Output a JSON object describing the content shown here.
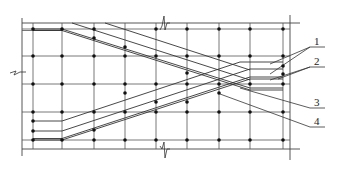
{
  "diagram": {
    "type": "structural-rebar-plan",
    "colors": {
      "line": "#333333",
      "node": "#111111",
      "background": "#ffffff"
    },
    "labels": [
      {
        "id": "1",
        "text": "1"
      },
      {
        "id": "2",
        "text": "2"
      },
      {
        "id": "3",
        "text": "3"
      },
      {
        "id": "4",
        "text": "4"
      }
    ],
    "grid": {
      "columns_x": [
        33,
        62,
        94,
        125,
        156,
        187,
        219,
        250,
        283
      ],
      "rows_y": [
        29,
        56,
        84,
        112,
        140
      ]
    },
    "break_symbols": [
      "top",
      "bottom",
      "left"
    ]
  }
}
